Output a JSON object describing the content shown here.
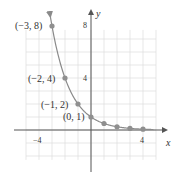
{
  "chart_data": {
    "type": "line",
    "title": "",
    "xlabel": "x",
    "ylabel": "y",
    "function": "y = (1/2)^x",
    "xlim": [
      -5,
      5
    ],
    "ylim": [
      -3,
      8
    ],
    "grid": true,
    "x_tick_labels": [
      {
        "value": -4,
        "label": "−4"
      },
      {
        "value": 4,
        "label": "4"
      }
    ],
    "y_tick_labels": [
      {
        "value": 4,
        "label": "4"
      },
      {
        "value": 8,
        "label": "8"
      }
    ],
    "points": [
      {
        "x": -3,
        "y": 8,
        "label": "(−3, 8)"
      },
      {
        "x": -2,
        "y": 4,
        "label": "(−2, 4)"
      },
      {
        "x": -1,
        "y": 2,
        "label": "(−1, 2)"
      },
      {
        "x": 0,
        "y": 1,
        "label": "(0, 1)"
      },
      {
        "x": 1,
        "y": 0.5,
        "label": ""
      },
      {
        "x": 2,
        "y": 0.25,
        "label": ""
      },
      {
        "x": 3,
        "y": 0.125,
        "label": ""
      },
      {
        "x": 4,
        "y": 0.0625,
        "label": ""
      }
    ],
    "colors": {
      "curve": "#8a8a8a",
      "points": "#8f8f8f",
      "axes": "#555555",
      "grid": "#dddddd"
    }
  },
  "labels": {
    "x_axis": "x",
    "y_axis": "y",
    "tick_x_neg4": "−4",
    "tick_x_4": "4",
    "tick_y_4": "4",
    "tick_y_8": "8",
    "pt_m3": "(−3, 8)",
    "pt_m2": "(−2, 4)",
    "pt_m1": "(−1, 2)",
    "pt_0": "(0, 1)"
  }
}
